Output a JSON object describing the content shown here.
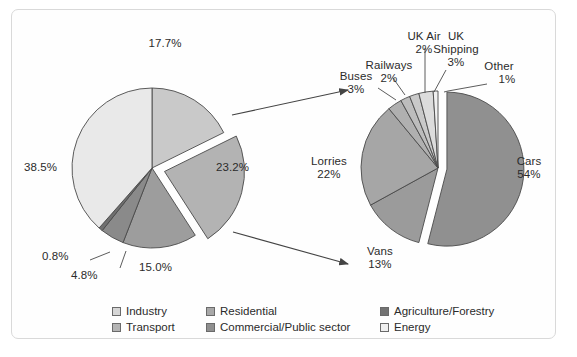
{
  "chart_data": [
    {
      "type": "pie",
      "name": "uk-emissions-by-sector",
      "title": "",
      "categories": [
        "Energy",
        "Industry",
        "Transport",
        "Commercial/Public sector",
        "Residential",
        "Agriculture/Forestry"
      ],
      "values": [
        38.5,
        17.7,
        23.2,
        15.0,
        4.8,
        0.8
      ],
      "labels": [
        "38.5%",
        "17.7%",
        "23.2%",
        "15.0%",
        "4.8%",
        "0.8%"
      ],
      "exploded": [
        "Transport"
      ],
      "legend_position": "bottom",
      "grid": false
    },
    {
      "type": "pie",
      "name": "transport-breakdown",
      "title": "",
      "categories": [
        "Cars",
        "Lorries",
        "Vans",
        "Buses",
        "Railways",
        "UK Air",
        "UK Shipping",
        "Other"
      ],
      "values": [
        54,
        22,
        13,
        3,
        2,
        2,
        3,
        1
      ],
      "labels": [
        "54%",
        "22%",
        "13%",
        "3%",
        "2%",
        "2%",
        "3%",
        "1%"
      ],
      "exploded": [
        "Cars"
      ],
      "legend_position": "none",
      "grid": false
    }
  ],
  "pie_left": {
    "slices": [
      {
        "name": "energy",
        "label": "38.5%",
        "value": 38.5
      },
      {
        "name": "industry",
        "label": "17.7%",
        "value": 17.7
      },
      {
        "name": "transport",
        "label": "23.2%",
        "value": 23.2
      },
      {
        "name": "commercial",
        "label": "15.0%",
        "value": 15.0
      },
      {
        "name": "residential",
        "label": "4.8%",
        "value": 4.8
      },
      {
        "name": "agriculture",
        "label": "0.8%",
        "value": 0.8
      }
    ]
  },
  "pie_right": {
    "slices": [
      {
        "name": "cars",
        "name_label": "Cars",
        "pct": "54%"
      },
      {
        "name": "lorries",
        "name_label": "Lorries",
        "pct": "22%"
      },
      {
        "name": "vans",
        "name_label": "Vans",
        "pct": "13%"
      },
      {
        "name": "buses",
        "name_label": "Buses",
        "pct": "3%"
      },
      {
        "name": "railways",
        "name_label": "Railways",
        "pct": "2%"
      },
      {
        "name": "ukair",
        "name_label": "UK Air",
        "pct": "2%"
      },
      {
        "name": "ukshipping",
        "name_label": "UK\nShipping",
        "pct": "3%"
      },
      {
        "name": "other",
        "name_label": "Other",
        "pct": "1%"
      }
    ],
    "uk_shipping_line1": "UK",
    "uk_shipping_line2": "Shipping"
  },
  "legend": {
    "items": [
      {
        "label": "Industry",
        "color": "#d6d6d6"
      },
      {
        "label": "Residential",
        "color": "#a8a8a8"
      },
      {
        "label": "Agriculture/Forestry",
        "color": "#737373"
      },
      {
        "label": "Transport",
        "color": "#b4b4b4"
      },
      {
        "label": "Commercial/Public sector",
        "color": "#8f8f8f"
      },
      {
        "label": "Energy",
        "color": "#efefef"
      }
    ]
  },
  "colors": {
    "energy": "#e9e9e9",
    "industry": "#c9c9c9",
    "transport": "#b3b3b3",
    "commercial": "#9d9d9d",
    "residential": "#8a8a8a",
    "agriculture": "#6f6f6f",
    "cars": "#909090",
    "lorries": "#a6a6a6",
    "vans": "#9b9b9b",
    "buses": "#b0b0b0",
    "railways": "#bdbdbd",
    "ukair": "#c9c9c9",
    "ukshipping": "#dcdcdc",
    "other": "#f0f0f0",
    "outline": "#4a4a4a",
    "text": "#2b2b2b",
    "frame": "#d9d9d9"
  }
}
